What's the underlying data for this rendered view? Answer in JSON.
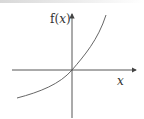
{
  "figure": {
    "y_axis_label": "f(",
    "y_axis_var": "x",
    "y_axis_close": ")",
    "x_axis_label": "x",
    "curve": "exponential-like increasing curve through origin",
    "colors": {
      "axis": "#444444",
      "curve": "#555555",
      "text": "#333333"
    }
  }
}
